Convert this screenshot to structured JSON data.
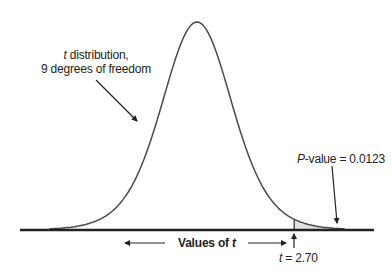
{
  "chart_data": {
    "type": "area",
    "title": "",
    "distribution": "t",
    "degrees_of_freedom": 9,
    "xlabel": "Values of t",
    "ylabel": "",
    "annotations": [
      {
        "text_italic": "t",
        "text": " distribution,",
        "line2": "9 degrees of freedom"
      },
      {
        "text_italic": "P",
        "text": "-value = 0.0123"
      },
      {
        "text_italic": "t",
        "text": " = 2.70"
      }
    ],
    "critical_t": 2.7,
    "p_value": 0.0123,
    "shaded_region": "right tail, t > 2.70",
    "grid": false,
    "legend": "none",
    "colors": {
      "curve": "#4a4a4a",
      "shade": "#e3e3e3",
      "axis": "#222222"
    }
  },
  "labels": {
    "dist_italic": "t",
    "dist_rest": " distribution,",
    "dist_line2": "9 degrees of freedom",
    "pval_italic": "P",
    "pval_rest": "-value = 0.0123",
    "axis_text": "Values of ",
    "axis_italic": "t",
    "t_italic": "t",
    "t_rest": " = 2.70"
  }
}
